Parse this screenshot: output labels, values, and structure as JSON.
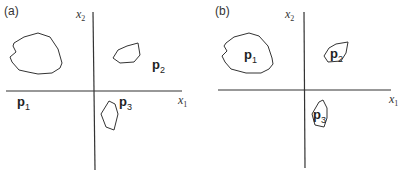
{
  "panels": [
    {
      "id": "a",
      "label": "(a)",
      "axes": {
        "x_label": "x",
        "x_sub": "1",
        "y_label": "x",
        "y_sub": "2"
      },
      "regions": [
        {
          "name": "p",
          "sub": "1"
        },
        {
          "name": "p",
          "sub": "2"
        },
        {
          "name": "p",
          "sub": "3"
        }
      ]
    },
    {
      "id": "b",
      "label": "(b)",
      "axes": {
        "x_label": "x",
        "x_sub": "1",
        "y_label": "x",
        "y_sub": "2"
      },
      "regions": [
        {
          "name": "p",
          "sub": "1"
        },
        {
          "name": "p",
          "sub": "2"
        },
        {
          "name": "p",
          "sub": "3"
        }
      ]
    }
  ],
  "colors": {
    "stroke": "#333333",
    "text": "#222222",
    "background": "#ffffff"
  }
}
